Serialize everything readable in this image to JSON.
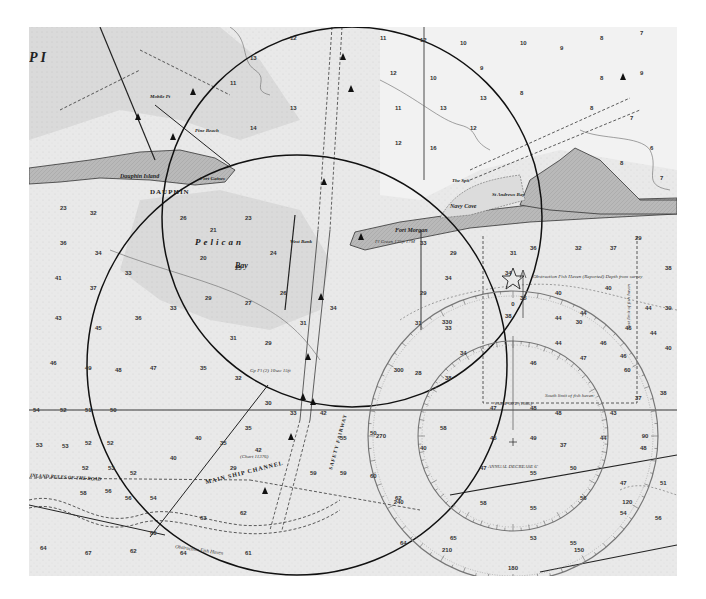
{
  "map": {
    "type": "nautical-chart",
    "style": "grayscale scanned chart",
    "colors": {
      "water": "#e9e9e9",
      "shallow": "#d4d4d4",
      "land": "#b8b8b8",
      "ink": "#1a1a1a",
      "background": "#ffffff"
    },
    "place_labels": {
      "dauphin_island": "Dauphin Island",
      "dauphin_caps": "DAUPHIN",
      "petit_bois_pass_fragment": "P  I",
      "pelican": "Pelican",
      "pelican_bay": "Bay",
      "west_bank": "West Bank",
      "fort_morgan": "Fort Morgan",
      "fort_morgan_light": "Fl Green 125ft 17M",
      "navy_cove": "Navy Cove",
      "the_spit": "The Spit",
      "st_andrews_bay": "St Andrews Bay",
      "fort_gaines": "Fort Gaines",
      "mobile_point": "Mobile Pt",
      "pine_beach": "Pine Beach",
      "main_ship_channel": "MAIN SHIP CHANNEL",
      "inland_rules": "INLAND RULES OF THE ROAD",
      "safety_fairway": "SAFETY FAIRWAY",
      "obstruction_fish_haven": "Obstruction Fish Haven",
      "obstruction_reported": "Obstruction Fish Haven (Reported) Depth from survey",
      "south_limit_fish_haven": "South limit of fish haven",
      "east_limit_fish_haven": "East limit of fish haven",
      "magnetic_variation": "VAR 4°00'E (1985)",
      "annual_decrease": "ANNUAL DECREASE 6'",
      "sand_island_light": "Gp Fl (2) 10sec 15ft",
      "channel_note": "(Chart 11376)"
    },
    "overlays": {
      "circle_a": {
        "cx": 352,
        "cy": 217,
        "r": 190
      },
      "circle_b": {
        "cx": 297,
        "cy": 365,
        "r": 210
      },
      "compass_rose": {
        "cx": 513,
        "cy": 436,
        "outer_r": 145,
        "inner_r": 95
      }
    },
    "soundings": [
      {
        "x": 60,
        "y": 210,
        "v": "23"
      },
      {
        "x": 90,
        "y": 215,
        "v": "32"
      },
      {
        "x": 60,
        "y": 245,
        "v": "36"
      },
      {
        "x": 95,
        "y": 255,
        "v": "34"
      },
      {
        "x": 55,
        "y": 280,
        "v": "41"
      },
      {
        "x": 90,
        "y": 290,
        "v": "37"
      },
      {
        "x": 125,
        "y": 275,
        "v": "33"
      },
      {
        "x": 55,
        "y": 320,
        "v": "43"
      },
      {
        "x": 95,
        "y": 330,
        "v": "45"
      },
      {
        "x": 135,
        "y": 320,
        "v": "36"
      },
      {
        "x": 50,
        "y": 365,
        "v": "46"
      },
      {
        "x": 85,
        "y": 370,
        "v": "49"
      },
      {
        "x": 115,
        "y": 372,
        "v": "48"
      },
      {
        "x": 150,
        "y": 370,
        "v": "47"
      },
      {
        "x": 33,
        "y": 412,
        "v": "54"
      },
      {
        "x": 60,
        "y": 412,
        "v": "52"
      },
      {
        "x": 85,
        "y": 412,
        "v": "51"
      },
      {
        "x": 110,
        "y": 412,
        "v": "50"
      },
      {
        "x": 36,
        "y": 447,
        "v": "53"
      },
      {
        "x": 62,
        "y": 448,
        "v": "53"
      },
      {
        "x": 85,
        "y": 445,
        "v": "52"
      },
      {
        "x": 107,
        "y": 445,
        "v": "52"
      },
      {
        "x": 82,
        "y": 470,
        "v": "52"
      },
      {
        "x": 108,
        "y": 470,
        "v": "53"
      },
      {
        "x": 130,
        "y": 475,
        "v": "52"
      },
      {
        "x": 80,
        "y": 495,
        "v": "58"
      },
      {
        "x": 105,
        "y": 493,
        "v": "56"
      },
      {
        "x": 125,
        "y": 500,
        "v": "56"
      },
      {
        "x": 150,
        "y": 500,
        "v": "54"
      },
      {
        "x": 150,
        "y": 535,
        "v": "60"
      },
      {
        "x": 40,
        "y": 550,
        "v": "64"
      },
      {
        "x": 85,
        "y": 555,
        "v": "67"
      },
      {
        "x": 130,
        "y": 553,
        "v": "62"
      },
      {
        "x": 180,
        "y": 555,
        "v": "64"
      },
      {
        "x": 245,
        "y": 555,
        "v": "61"
      },
      {
        "x": 200,
        "y": 520,
        "v": "63"
      },
      {
        "x": 240,
        "y": 515,
        "v": "62"
      },
      {
        "x": 170,
        "y": 460,
        "v": "40"
      },
      {
        "x": 195,
        "y": 440,
        "v": "40"
      },
      {
        "x": 220,
        "y": 445,
        "v": "35"
      },
      {
        "x": 245,
        "y": 430,
        "v": "35"
      },
      {
        "x": 230,
        "y": 470,
        "v": "29"
      },
      {
        "x": 255,
        "y": 452,
        "v": "42"
      },
      {
        "x": 265,
        "y": 405,
        "v": "30"
      },
      {
        "x": 290,
        "y": 415,
        "v": "33"
      },
      {
        "x": 320,
        "y": 415,
        "v": "42"
      },
      {
        "x": 340,
        "y": 440,
        "v": "55"
      },
      {
        "x": 370,
        "y": 435,
        "v": "50"
      },
      {
        "x": 310,
        "y": 475,
        "v": "59"
      },
      {
        "x": 340,
        "y": 475,
        "v": "59"
      },
      {
        "x": 370,
        "y": 478,
        "v": "60"
      },
      {
        "x": 395,
        "y": 500,
        "v": "62"
      },
      {
        "x": 420,
        "y": 450,
        "v": "40"
      },
      {
        "x": 440,
        "y": 430,
        "v": "58"
      },
      {
        "x": 400,
        "y": 545,
        "v": "64"
      },
      {
        "x": 450,
        "y": 540,
        "v": "65"
      },
      {
        "x": 180,
        "y": 220,
        "v": "26"
      },
      {
        "x": 210,
        "y": 232,
        "v": "21"
      },
      {
        "x": 245,
        "y": 220,
        "v": "23"
      },
      {
        "x": 200,
        "y": 260,
        "v": "20"
      },
      {
        "x": 235,
        "y": 270,
        "v": "25"
      },
      {
        "x": 270,
        "y": 255,
        "v": "24"
      },
      {
        "x": 205,
        "y": 300,
        "v": "29"
      },
      {
        "x": 245,
        "y": 305,
        "v": "27"
      },
      {
        "x": 280,
        "y": 295,
        "v": "26"
      },
      {
        "x": 170,
        "y": 310,
        "v": "33"
      },
      {
        "x": 300,
        "y": 325,
        "v": "31"
      },
      {
        "x": 330,
        "y": 310,
        "v": "34"
      },
      {
        "x": 230,
        "y": 340,
        "v": "31"
      },
      {
        "x": 265,
        "y": 345,
        "v": "29"
      },
      {
        "x": 200,
        "y": 370,
        "v": "35"
      },
      {
        "x": 235,
        "y": 380,
        "v": "32"
      },
      {
        "x": 290,
        "y": 40,
        "v": "12"
      },
      {
        "x": 250,
        "y": 60,
        "v": "13"
      },
      {
        "x": 230,
        "y": 85,
        "v": "11"
      },
      {
        "x": 290,
        "y": 110,
        "v": "13"
      },
      {
        "x": 250,
        "y": 130,
        "v": "14"
      },
      {
        "x": 380,
        "y": 40,
        "v": "11"
      },
      {
        "x": 420,
        "y": 42,
        "v": "12"
      },
      {
        "x": 460,
        "y": 45,
        "v": "10"
      },
      {
        "x": 390,
        "y": 75,
        "v": "12"
      },
      {
        "x": 430,
        "y": 80,
        "v": "10"
      },
      {
        "x": 480,
        "y": 70,
        "v": "9"
      },
      {
        "x": 520,
        "y": 45,
        "v": "10"
      },
      {
        "x": 560,
        "y": 50,
        "v": "9"
      },
      {
        "x": 600,
        "y": 40,
        "v": "8"
      },
      {
        "x": 640,
        "y": 35,
        "v": "7"
      },
      {
        "x": 600,
        "y": 80,
        "v": "8"
      },
      {
        "x": 640,
        "y": 75,
        "v": "9"
      },
      {
        "x": 395,
        "y": 110,
        "v": "11"
      },
      {
        "x": 440,
        "y": 110,
        "v": "13"
      },
      {
        "x": 480,
        "y": 100,
        "v": "13"
      },
      {
        "x": 520,
        "y": 95,
        "v": "8"
      },
      {
        "x": 395,
        "y": 145,
        "v": "12"
      },
      {
        "x": 430,
        "y": 150,
        "v": "16"
      },
      {
        "x": 470,
        "y": 130,
        "v": "12"
      },
      {
        "x": 590,
        "y": 110,
        "v": "8"
      },
      {
        "x": 630,
        "y": 120,
        "v": "7"
      },
      {
        "x": 650,
        "y": 150,
        "v": "6"
      },
      {
        "x": 620,
        "y": 165,
        "v": "8"
      },
      {
        "x": 660,
        "y": 180,
        "v": "7"
      },
      {
        "x": 420,
        "y": 245,
        "v": "33"
      },
      {
        "x": 450,
        "y": 255,
        "v": "29"
      },
      {
        "x": 445,
        "y": 280,
        "v": "34"
      },
      {
        "x": 420,
        "y": 295,
        "v": "29"
      },
      {
        "x": 415,
        "y": 325,
        "v": "31"
      },
      {
        "x": 445,
        "y": 330,
        "v": "33"
      },
      {
        "x": 460,
        "y": 355,
        "v": "34"
      },
      {
        "x": 415,
        "y": 375,
        "v": "28"
      },
      {
        "x": 445,
        "y": 380,
        "v": "38"
      },
      {
        "x": 510,
        "y": 255,
        "v": "31"
      },
      {
        "x": 530,
        "y": 250,
        "v": "36"
      },
      {
        "x": 575,
        "y": 250,
        "v": "32"
      },
      {
        "x": 610,
        "y": 250,
        "v": "37"
      },
      {
        "x": 635,
        "y": 240,
        "v": "29"
      },
      {
        "x": 665,
        "y": 270,
        "v": "38"
      },
      {
        "x": 505,
        "y": 275,
        "v": "34"
      },
      {
        "x": 520,
        "y": 300,
        "v": "35"
      },
      {
        "x": 555,
        "y": 295,
        "v": "40"
      },
      {
        "x": 605,
        "y": 290,
        "v": "40"
      },
      {
        "x": 645,
        "y": 310,
        "v": "44"
      },
      {
        "x": 665,
        "y": 310,
        "v": "39"
      },
      {
        "x": 505,
        "y": 318,
        "v": "38"
      },
      {
        "x": 555,
        "y": 320,
        "v": "44"
      },
      {
        "x": 580,
        "y": 315,
        "v": "44"
      },
      {
        "x": 625,
        "y": 330,
        "v": "46"
      },
      {
        "x": 555,
        "y": 345,
        "v": "44"
      },
      {
        "x": 600,
        "y": 345,
        "v": "46"
      },
      {
        "x": 650,
        "y": 335,
        "v": "44"
      },
      {
        "x": 530,
        "y": 365,
        "v": "46"
      },
      {
        "x": 580,
        "y": 360,
        "v": "47"
      },
      {
        "x": 620,
        "y": 358,
        "v": "46"
      },
      {
        "x": 665,
        "y": 350,
        "v": "40"
      },
      {
        "x": 490,
        "y": 410,
        "v": "47"
      },
      {
        "x": 530,
        "y": 410,
        "v": "48"
      },
      {
        "x": 555,
        "y": 415,
        "v": "48"
      },
      {
        "x": 610,
        "y": 415,
        "v": "43"
      },
      {
        "x": 635,
        "y": 400,
        "v": "37"
      },
      {
        "x": 660,
        "y": 395,
        "v": "38"
      },
      {
        "x": 490,
        "y": 440,
        "v": "45"
      },
      {
        "x": 530,
        "y": 440,
        "v": "49"
      },
      {
        "x": 560,
        "y": 447,
        "v": "37"
      },
      {
        "x": 600,
        "y": 440,
        "v": "44"
      },
      {
        "x": 640,
        "y": 450,
        "v": "48"
      },
      {
        "x": 480,
        "y": 470,
        "v": "47"
      },
      {
        "x": 530,
        "y": 475,
        "v": "55"
      },
      {
        "x": 570,
        "y": 470,
        "v": "50"
      },
      {
        "x": 620,
        "y": 485,
        "v": "47"
      },
      {
        "x": 660,
        "y": 485,
        "v": "51"
      },
      {
        "x": 480,
        "y": 505,
        "v": "58"
      },
      {
        "x": 530,
        "y": 510,
        "v": "55"
      },
      {
        "x": 580,
        "y": 500,
        "v": "56"
      },
      {
        "x": 620,
        "y": 515,
        "v": "54"
      },
      {
        "x": 530,
        "y": 540,
        "v": "53"
      },
      {
        "x": 570,
        "y": 545,
        "v": "55"
      },
      {
        "x": 655,
        "y": 520,
        "v": "56"
      }
    ],
    "compass_ticks_labels": [
      "0",
      "30",
      "60",
      "90",
      "120",
      "150",
      "180",
      "210",
      "240",
      "270",
      "300",
      "330"
    ]
  }
}
